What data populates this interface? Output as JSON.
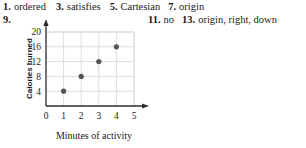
{
  "answers": {
    "row1": [
      {
        "num": "1.",
        "text": "ordered"
      },
      {
        "num": "3.",
        "text": "satisfies"
      },
      {
        "num": "5.",
        "text": "Cartesian"
      },
      {
        "num": "7.",
        "text": "origin"
      }
    ],
    "row2_left": [
      {
        "num": "9.",
        "text": ""
      }
    ],
    "row2_right": [
      {
        "num": "11.",
        "text": "no"
      },
      {
        "num": "13.",
        "text": "origin, right, down"
      }
    ]
  },
  "chart_data": {
    "type": "scatter",
    "title": "",
    "xlabel": "Minutes of activity",
    "ylabel": "Calories burned",
    "x": [
      1,
      2,
      3,
      4
    ],
    "y": [
      4,
      8,
      12,
      16
    ],
    "points": [
      {
        "x": 1,
        "y": 4
      },
      {
        "x": 2,
        "y": 8
      },
      {
        "x": 3,
        "y": 12
      },
      {
        "x": 4,
        "y": 16
      }
    ],
    "xticks": [
      0,
      1,
      2,
      3,
      4,
      5
    ],
    "yticks": [
      4,
      8,
      12,
      16,
      20
    ],
    "xlim": [
      0,
      5
    ],
    "ylim": [
      0,
      20
    ],
    "grid": true,
    "legend": "none",
    "marker_color": "#555555",
    "grid_color": "#d9d9d9",
    "axis_color": "#2b2b2b"
  }
}
